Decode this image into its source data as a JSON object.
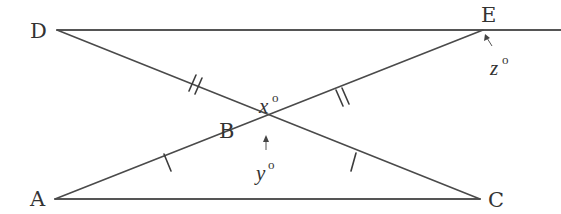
{
  "figure": {
    "type": "geometry-diagram",
    "points": {
      "D": {
        "label": "D",
        "x": 57,
        "y": 30
      },
      "E": {
        "label": "E",
        "x": 483,
        "y": 30
      },
      "A": {
        "label": "A",
        "x": 55,
        "y": 199
      },
      "C": {
        "label": "C",
        "x": 480,
        "y": 199
      },
      "B": {
        "label": "B",
        "x": 266,
        "y": 132
      }
    },
    "segments": [
      {
        "from": "D",
        "to": "E",
        "extends_right": true
      },
      {
        "from": "A",
        "to": "C"
      },
      {
        "from": "D",
        "to": "C",
        "through": "B"
      },
      {
        "from": "A",
        "to": "E",
        "through": "B"
      }
    ],
    "tick_marks": [
      {
        "segment": "DB",
        "count": 2
      },
      {
        "segment": "BE",
        "count": 2
      },
      {
        "segment": "AB",
        "count": 1
      },
      {
        "segment": "BC",
        "count": 1
      }
    ],
    "angles": {
      "x": {
        "var": "x",
        "degree": "o",
        "at": "B",
        "position": "top angle DBE"
      },
      "y": {
        "var": "y",
        "degree": "o",
        "at": "B",
        "position": "bottom angle ABC",
        "arrow": true
      },
      "z": {
        "var": "z",
        "degree": "o",
        "at": "E",
        "position": "angle below E on right",
        "arrow": true
      }
    }
  },
  "labels": {
    "D": "D",
    "E": "E",
    "A": "A",
    "C": "C",
    "B": "B",
    "x_var": "x",
    "y_var": "y",
    "z_var": "z",
    "degree": "o"
  }
}
